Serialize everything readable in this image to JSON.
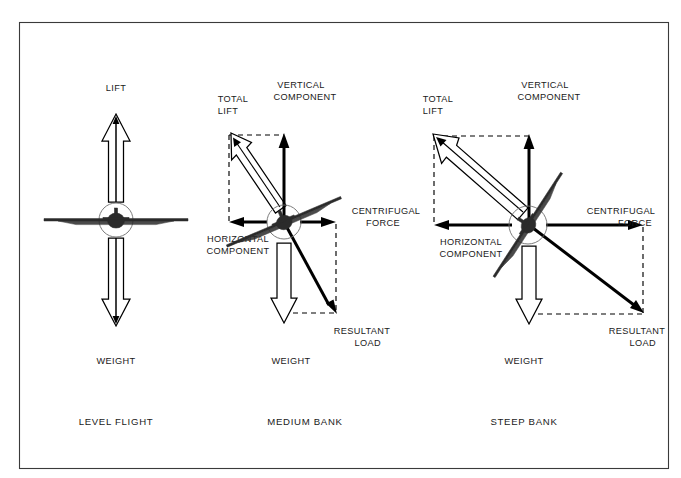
{
  "figure": {
    "title_visible": false,
    "background_color": "#ffffff",
    "ink_color": "#000000",
    "border_color": "#3a3a3a"
  },
  "panels": [
    {
      "id": "level-flight",
      "caption": "LEVEL FLIGHT",
      "bank_angle_deg": 0,
      "weight_label": "WEIGHT",
      "labels": {
        "lift": "LIFT"
      }
    },
    {
      "id": "medium-bank",
      "caption": "MEDIUM BANK",
      "bank_angle_deg": 25,
      "weight_label": "WEIGHT",
      "labels": {
        "total_lift_line1": "TOTAL",
        "total_lift_line2": "LIFT",
        "vertical_component_line1": "VERTICAL",
        "vertical_component_line2": "COMPONENT",
        "horizontal_component_line1": "HORIZONTAL",
        "horizontal_component_line2": "COMPONENT",
        "centrifugal_force_line1": "CENTRIFUGAL",
        "centrifugal_force_line2": "FORCE",
        "resultant_load_line1": "RESULTANT",
        "resultant_load_line2": "LOAD"
      }
    },
    {
      "id": "steep-bank",
      "caption": "STEEP BANK",
      "bank_angle_deg": 55,
      "weight_label": "WEIGHT",
      "labels": {
        "total_lift_line1": "TOTAL",
        "total_lift_line2": "LIFT",
        "vertical_component_line1": "VERTICAL",
        "vertical_component_line2": "COMPONENT",
        "horizontal_component_line1": "HORIZONTAL",
        "horizontal_component_line2": "COMPONENT",
        "centrifugal_force_line1": "CENTRIFUGAL",
        "centrifugal_force_line2": "FORCE",
        "resultant_load_line1": "RESULTANT",
        "resultant_load_line2": "LOAD"
      }
    }
  ]
}
